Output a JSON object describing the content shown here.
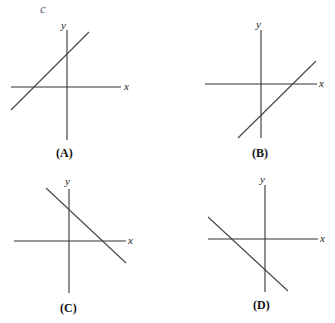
{
  "annotation": {
    "handwritten_mark": "c"
  },
  "panels": [
    {
      "id": "A",
      "label": "(A)",
      "x_axis_label": "x",
      "y_axis_label": "y",
      "line": {
        "slope_sign": "positive",
        "y_intercept": "positive",
        "x_intercept": "negative"
      }
    },
    {
      "id": "B",
      "label": "(B)",
      "x_axis_label": "x",
      "y_axis_label": "y",
      "line": {
        "slope_sign": "positive",
        "y_intercept": "negative",
        "x_intercept": "positive"
      }
    },
    {
      "id": "C",
      "label": "(C)",
      "x_axis_label": "x",
      "y_axis_label": "y",
      "line": {
        "slope_sign": "negative",
        "y_intercept": "positive",
        "x_intercept": "positive"
      }
    },
    {
      "id": "D",
      "label": "(D)",
      "x_axis_label": "x",
      "y_axis_label": "y",
      "line": {
        "slope_sign": "negative",
        "y_intercept": "negative",
        "x_intercept": "negative"
      }
    }
  ],
  "colors": {
    "axis": "#333333",
    "line": "#444444",
    "background": "#ffffff"
  }
}
